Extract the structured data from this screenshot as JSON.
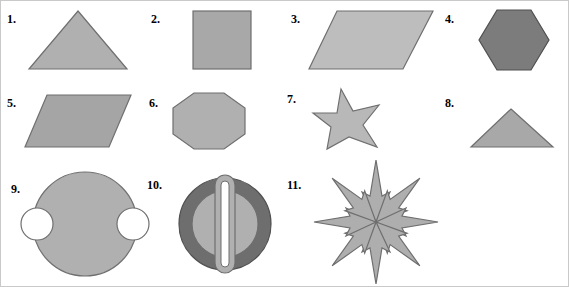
{
  "page": {
    "background_color": "#ffffff",
    "border_color": "#c9c9c9",
    "width": 569,
    "height": 287,
    "label_color": "#000000",
    "label_font_weight": "bold"
  },
  "palette": {
    "light_gray": "#b8b8b8",
    "mid_gray": "#a3a3a3",
    "dark_gray": "#6e6e6e",
    "darker_gray": "#585858",
    "outline": "#7a7a7a",
    "outline_dark": "#4a4a4a",
    "white": "#ffffff"
  },
  "rows": [
    {
      "row_index": 0,
      "items": [
        {
          "number": "1.",
          "shape": "triangle",
          "shape_label": "isosceles-triangle",
          "fill": "#b0b0b0",
          "stroke": "#6f6f6f",
          "num_x": 6,
          "num_y": 12,
          "fig_x": 22,
          "fig_y": 6,
          "fig_w": 110,
          "fig_h": 66
        },
        {
          "number": "2.",
          "shape": "square",
          "shape_label": "square",
          "fill": "#a8a8a8",
          "stroke": "#6f6f6f",
          "num_x": 150,
          "num_y": 12,
          "fig_x": 168,
          "fig_y": 6,
          "fig_w": 110,
          "fig_h": 66
        },
        {
          "number": "3.",
          "shape": "parallelogram",
          "shape_label": "parallelogram-right-lean",
          "fill": "#bdbdbd",
          "stroke": "#6f6f6f",
          "num_x": 290,
          "num_y": 12,
          "fig_x": 306,
          "fig_y": 6,
          "fig_w": 128,
          "fig_h": 66
        },
        {
          "number": "4.",
          "shape": "hexagon",
          "shape_label": "hexagon",
          "fill": "#7c7c7c",
          "stroke": "#4f4f4f",
          "num_x": 444,
          "num_y": 12,
          "fig_x": 460,
          "fig_y": 6,
          "fig_w": 104,
          "fig_h": 66
        }
      ]
    },
    {
      "row_index": 1,
      "items": [
        {
          "number": "5.",
          "shape": "parallelogram",
          "shape_label": "parallelogram-left-lean",
          "fill": "#a5a5a5",
          "stroke": "#6f6f6f",
          "num_x": 6,
          "num_y": 96,
          "fig_x": 22,
          "fig_y": 90,
          "fig_w": 112,
          "fig_h": 60
        },
        {
          "number": "6.",
          "shape": "octagon",
          "shape_label": "octagon",
          "fill": "#b0b0b0",
          "stroke": "#6f6f6f",
          "num_x": 148,
          "num_y": 96,
          "fig_x": 164,
          "fig_y": 90,
          "fig_w": 104,
          "fig_h": 60
        },
        {
          "number": "7.",
          "shape": "star",
          "shape_label": "five-pointed-star",
          "fill": "#b8b8b8",
          "stroke": "#6f6f6f",
          "num_x": 286,
          "num_y": 92,
          "fig_x": 300,
          "fig_y": 86,
          "fig_w": 110,
          "fig_h": 64
        },
        {
          "number": "8.",
          "shape": "triangle",
          "shape_label": "isosceles-triangle-wide",
          "fill": "#a8a8a8",
          "stroke": "#6f6f6f",
          "num_x": 444,
          "num_y": 96,
          "fig_x": 460,
          "fig_y": 90,
          "fig_w": 104,
          "fig_h": 60
        }
      ]
    },
    {
      "row_index": 2,
      "items": [
        {
          "number": "9.",
          "shape": "circle-with-notches",
          "shape_label": "circle-with-two-semicircular-notches",
          "fill": "#b0b0b0",
          "stroke": "#6f6f6f",
          "num_x": 10,
          "num_y": 182,
          "fig_x": 26,
          "fig_y": 166,
          "fig_w": 120,
          "fig_h": 114
        },
        {
          "number": "10.",
          "shape": "circle-with-bar",
          "shape_label": "dark-ring-with-inner-disc-and-vertical-bar",
          "fill": "#6e6e6e",
          "inner_fill": "#b0b0b0",
          "bar_fill": "#ffffff",
          "stroke": "#4f4f4f",
          "num_x": 146,
          "num_y": 178,
          "fig_x": 168,
          "fig_y": 166,
          "fig_w": 116,
          "fig_h": 114
        },
        {
          "number": "11.",
          "shape": "eight-point-arrow-burst",
          "shape_label": "radial-arrow-burst",
          "fill": "#aeaeae",
          "stroke": "#6f6f6f",
          "num_x": 286,
          "num_y": 178,
          "fig_x": 300,
          "fig_y": 156,
          "fig_w": 150,
          "fig_h": 130
        }
      ]
    }
  ]
}
